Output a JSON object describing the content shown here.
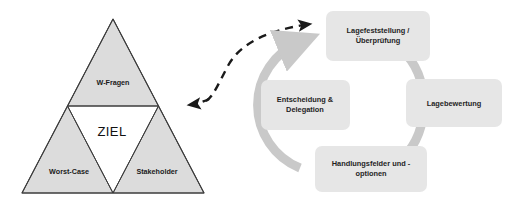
{
  "colors": {
    "triangle_fill": "#dcdcdc",
    "triangle_stroke": "#3c3c3c",
    "center_fill": "#ffffff",
    "box_fill": "#e6e6e6",
    "ring_color": "#c9c9c9",
    "dashed_arrow": "#1a1a1a",
    "text": "#1a1a1a",
    "page_background": "#ffffff"
  },
  "triangle": {
    "name": "zielscheibe-triangle",
    "center_label": "ZIEL",
    "segments": [
      {
        "id": "top",
        "label": "W-Fragen"
      },
      {
        "id": "bottom-left",
        "label": "Worst-Case"
      },
      {
        "id": "bottom-right",
        "label": "Stakeholder"
      }
    ]
  },
  "connector": {
    "name": "dashed-bidirectional-arrow",
    "style": "dashed",
    "arrowheads": [
      "left",
      "right"
    ],
    "from": "zielscheibe-triangle",
    "to": "cycle-step-lagefeststellung"
  },
  "cycle": {
    "name": "management-cycle",
    "direction": "clockwise",
    "steps": [
      {
        "id": "lagefeststellung",
        "lines": [
          "Lagefeststellung /",
          "Überprüfung"
        ],
        "position": "top"
      },
      {
        "id": "lagebewertung",
        "lines": [
          "Lagebewertung"
        ],
        "position": "right"
      },
      {
        "id": "handlungsfelder",
        "lines": [
          "Handlungsfelder und -",
          "optionen"
        ],
        "position": "bottom"
      },
      {
        "id": "entscheidung",
        "lines": [
          "Entscheidung &",
          "Delegation"
        ],
        "position": "left"
      }
    ]
  }
}
